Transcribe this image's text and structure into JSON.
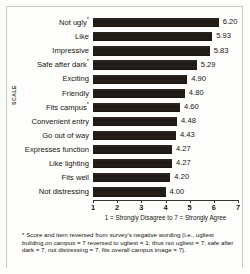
{
  "chart_data": {
    "type": "bar",
    "orientation": "horizontal",
    "title": "",
    "xlabel": "1 = Strongly Disagree to 7 = Strongly Agree",
    "ylabel": "SCALE",
    "xlim": [
      1,
      7
    ],
    "xticks": [
      "1",
      "2",
      "3",
      "4",
      "5",
      "6",
      "7"
    ],
    "grid": false,
    "legend": null,
    "bar_color": "#241f1c",
    "categories": [
      "Not ugly*",
      "Like",
      "Impressive",
      "Safe after dark*",
      "Exciting",
      "Friendly",
      "Fits campus*",
      "Convenient entry",
      "Go out of way",
      "Expresses function",
      "Like lighting",
      "Fits well",
      "Not distressing"
    ],
    "values": [
      6.2,
      5.93,
      5.83,
      5.29,
      4.9,
      4.8,
      4.6,
      4.48,
      4.43,
      4.27,
      4.27,
      4.2,
      4.0
    ],
    "value_labels": [
      "6.20",
      "5.93",
      "5.83",
      "5.29",
      "4.90",
      "4.80",
      "4.60",
      "4.48",
      "4.43",
      "4.27",
      "4.27",
      "4.20",
      "4.00"
    ],
    "starred": [
      true,
      false,
      false,
      true,
      false,
      false,
      true,
      false,
      false,
      false,
      false,
      false,
      false
    ],
    "annotations": [
      "* Score and item reversed from survey's negative wording (i.e., ugliest building on campus = 7 reversed to ugliest = 1; thus not ugliest = 7, safe after dark = 7, not distressing = 7, fits overall campus image = 7)."
    ]
  },
  "footnote": {
    "marker": "*",
    "text": "Score and item reversed from survey's negative wording (i.e., ugliest building on campus = 7 reversed to ugliest = 1; thus not ugliest = 7, safe after dark = 7, not distressing = 7, fits overall campus image = 7)."
  }
}
